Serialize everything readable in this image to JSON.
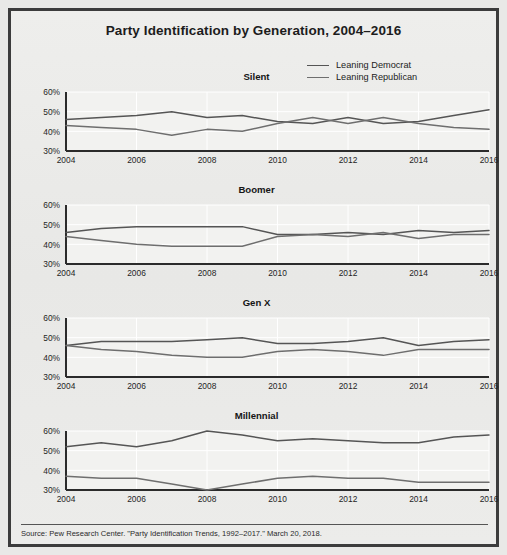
{
  "figure": {
    "title": "Party Identification by Generation, 2004–2016",
    "source": "Source: Pew Research Center. \"Party Identification Trends, 1992–2017.\" March 20, 2018."
  },
  "legend": {
    "items": [
      {
        "label": "Leaning Democrat",
        "color": "#555555"
      },
      {
        "label": "Leaning Republican",
        "color": "#6e6e6e"
      }
    ]
  },
  "axis": {
    "y_ticks": [
      "60%",
      "50%",
      "40%",
      "30%"
    ],
    "x_ticks": [
      "2004",
      "2006",
      "2008",
      "2010",
      "2012",
      "2014",
      "2016"
    ]
  },
  "chart_data": {
    "type": "line",
    "title": "Party Identification by Generation, 2004–2016",
    "xlabel": "",
    "ylabel": "",
    "ylim": [
      30,
      60
    ],
    "xlim": [
      2004,
      2016
    ],
    "grid": true,
    "legend_position": "top-right",
    "x": [
      2004,
      2005,
      2006,
      2007,
      2008,
      2009,
      2010,
      2011,
      2012,
      2013,
      2014,
      2015,
      2016
    ],
    "panels": [
      {
        "name": "Silent",
        "series": [
          {
            "name": "Leaning Democrat",
            "values": [
              46,
              47,
              48,
              50,
              47,
              48,
              45,
              44,
              47,
              44,
              45,
              48,
              51
            ]
          },
          {
            "name": "Leaning Republican",
            "values": [
              43,
              42,
              41,
              38,
              41,
              40,
              44,
              47,
              44,
              47,
              44,
              42,
              41
            ]
          }
        ]
      },
      {
        "name": "Boomer",
        "series": [
          {
            "name": "Leaning Democrat",
            "values": [
              46,
              48,
              49,
              49,
              49,
              49,
              45,
              45,
              46,
              45,
              47,
              46,
              47
            ]
          },
          {
            "name": "Leaning Republican",
            "values": [
              44,
              42,
              40,
              39,
              39,
              39,
              44,
              45,
              44,
              46,
              43,
              45,
              45
            ]
          }
        ]
      },
      {
        "name": "Gen X",
        "series": [
          {
            "name": "Leaning Democrat",
            "values": [
              46,
              48,
              48,
              48,
              49,
              50,
              47,
              47,
              48,
              50,
              46,
              48,
              49
            ]
          },
          {
            "name": "Leaning Republican",
            "values": [
              46,
              44,
              43,
              41,
              40,
              40,
              43,
              44,
              43,
              41,
              44,
              44,
              44
            ]
          }
        ]
      },
      {
        "name": "Millennial",
        "series": [
          {
            "name": "Leaning Democrat",
            "values": [
              52,
              54,
              52,
              55,
              60,
              58,
              55,
              56,
              55,
              54,
              54,
              57,
              58
            ]
          },
          {
            "name": "Leaning Republican",
            "values": [
              37,
              36,
              36,
              33,
              30,
              33,
              36,
              37,
              36,
              36,
              34,
              34,
              34
            ]
          }
        ]
      }
    ]
  }
}
